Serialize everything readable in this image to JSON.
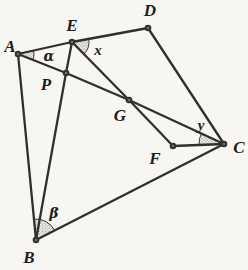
{
  "figure": {
    "type": "geometry-diagram",
    "background": "#f7f6f3",
    "line_color": "#2f2f2f",
    "points": {
      "A": "A",
      "B": "B",
      "C": "C",
      "D": "D",
      "E": "E",
      "F": "F",
      "G": "G",
      "P": "P"
    },
    "angles": {
      "alpha": "α",
      "beta": "β",
      "x": "x",
      "y": "y"
    },
    "edges": [
      "A-E-D",
      "A-P-G-C",
      "E-P-B",
      "E-G-F",
      "A-B",
      "D-C",
      "F-C",
      "B-C"
    ],
    "angle_marks": [
      {
        "vertex": "A",
        "label": "α",
        "between": [
          "ray AE",
          "ray AP"
        ]
      },
      {
        "vertex": "E",
        "label": "x",
        "between": [
          "ray ED",
          "ray EG"
        ]
      },
      {
        "vertex": "B",
        "label": "β",
        "between": [
          "ray BA",
          "ray BC"
        ]
      },
      {
        "vertex": "C",
        "label": "y",
        "between": [
          "ray CF",
          "ray CG"
        ]
      }
    ]
  }
}
